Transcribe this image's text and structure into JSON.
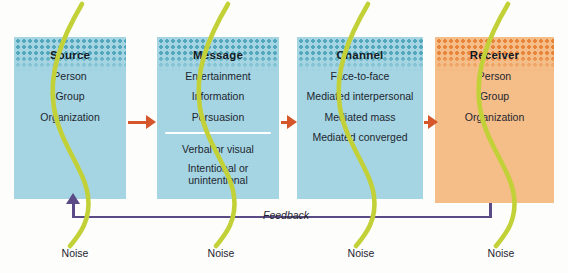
{
  "diagram": {
    "colors": {
      "box_blue": "#a5d5e2",
      "box_orange": "#f5bd87",
      "dot_blue": "#53a7bd",
      "dot_orange": "#e8833a",
      "arrow_orange": "#d4562a",
      "feedback_purple": "#5a4a86",
      "noise_green": "#c3d139",
      "text_dark": "#1d2630",
      "divider_white": "#ffffff"
    },
    "stages": [
      {
        "id": "source",
        "title": "Source",
        "items": [
          "Person",
          "Group",
          "Organization"
        ],
        "color": "blue",
        "divider_after": null
      },
      {
        "id": "message",
        "title": "Message",
        "items": [
          "Entertainment",
          "Information",
          "Persuasion",
          "Verbal or visual",
          "Intentional or unintentional"
        ],
        "color": "blue",
        "divider_after": 2
      },
      {
        "id": "channel",
        "title": "Channel",
        "items": [
          "Face-to-face",
          "Mediated interpersonal",
          "Mediated mass",
          "Mediated converged"
        ],
        "color": "blue",
        "divider_after": null
      },
      {
        "id": "receiver",
        "title": "Receiver",
        "items": [
          "Person",
          "Group",
          "Organization"
        ],
        "color": "orange",
        "divider_after": null
      }
    ],
    "connectors": [
      {
        "id": "source-to-message",
        "from": "source",
        "to": "message"
      },
      {
        "id": "message-to-channel",
        "from": "message",
        "to": "channel"
      },
      {
        "id": "channel-to-receiver",
        "from": "channel",
        "to": "receiver"
      }
    ],
    "feedback": {
      "label": "Feedback",
      "from": "receiver",
      "to": "source"
    },
    "noise_labels": [
      "Noise",
      "Noise",
      "Noise",
      "Noise"
    ]
  }
}
